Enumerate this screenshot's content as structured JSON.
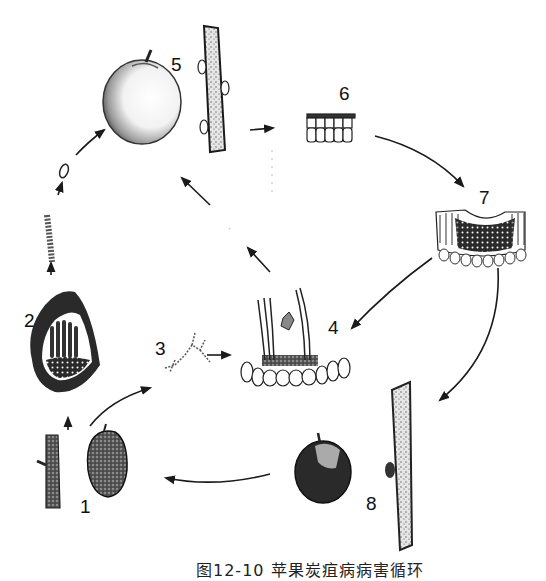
{
  "figure": {
    "caption": "图12-10  苹果炭疽病病害循环",
    "background": "#ffffff",
    "ink_color": "#1a1a1a"
  },
  "stages": [
    {
      "number": "1",
      "label_text": "1",
      "content": "diseased mummified fruit and infected twig (overwintering source)"
    },
    {
      "number": "2",
      "label_text": "2",
      "content": "acervulus with conidiophores in section, releasing spore chain"
    },
    {
      "number": "3",
      "label_text": "3",
      "content": "germinating conidia"
    },
    {
      "number": "4",
      "label_text": "4",
      "content": "infection of fruit epidermis with hyphae"
    },
    {
      "number": "5",
      "label_text": "5",
      "content": "healthy apple fruit and twig"
    },
    {
      "number": "6",
      "label_text": "6",
      "content": "epidermal cell layer"
    },
    {
      "number": "7",
      "label_text": "7",
      "content": "diseased tissue section with fungal colonization"
    },
    {
      "number": "8",
      "label_text": "8",
      "content": "rotting apple fruit and cankered twig"
    }
  ],
  "arrows": [
    {
      "from": "1",
      "to": "2"
    },
    {
      "from": "1",
      "to": "3"
    },
    {
      "from": "2",
      "to": "5"
    },
    {
      "from": "3",
      "to": "4"
    },
    {
      "from": "4",
      "to": "5"
    },
    {
      "from": "5",
      "to": "6"
    },
    {
      "from": "6",
      "to": "7"
    },
    {
      "from": "7",
      "to": "4"
    },
    {
      "from": "7",
      "to": "8"
    },
    {
      "from": "8",
      "to": "1"
    }
  ]
}
